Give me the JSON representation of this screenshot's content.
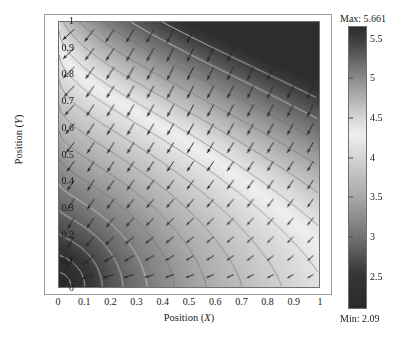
{
  "chart_data": {
    "type": "heatmap",
    "title": "",
    "subtitle": "",
    "xlabel": "Position (X)",
    "ylabel": "Position (Y)",
    "xlabel_symbol": "X",
    "ylabel_symbol": "Y",
    "xlabel_prefix": "Position (",
    "ylabel_prefix": "Position (",
    "label_suffix": ")",
    "xlim": [
      0,
      1
    ],
    "ylim": [
      0,
      1
    ],
    "xticks": [
      "0",
      "0.1",
      "0.2",
      "0.3",
      "0.4",
      "0.5",
      "0.6",
      "0.7",
      "0.8",
      "0.9",
      "1"
    ],
    "yticks": [
      "0",
      "0.1",
      "0.2",
      "0.3",
      "0.4",
      "0.5",
      "0.6",
      "0.7",
      "0.8",
      "0.9",
      "1"
    ],
    "xtick_values": [
      0,
      0.1,
      0.2,
      0.3,
      0.4,
      0.5,
      0.6,
      0.7,
      0.8,
      0.9,
      1
    ],
    "ytick_values": [
      0,
      0.1,
      0.2,
      0.3,
      0.4,
      0.5,
      0.6,
      0.7,
      0.8,
      0.9,
      1
    ],
    "grid": false,
    "legend": "none",
    "overlays": [
      "contour-lines",
      "vector-field-arrows"
    ],
    "zmin": 2.09,
    "zmax": 5.661,
    "colorbar": {
      "max_label": "Max: 5.661",
      "min_label": "Min: 2.09",
      "max_value": 5.661,
      "min_value": 2.09,
      "orientation": "vertical",
      "position": "right",
      "colormap": "grayscale-nonmonotonic",
      "ticks": [
        "5.5",
        "5",
        "4.5",
        "4",
        "3.5",
        "3",
        "2.5"
      ],
      "tick_values": [
        5.5,
        5.0,
        4.5,
        4.0,
        3.5,
        3.0,
        2.5
      ],
      "stops": [
        {
          "value": 2.09,
          "color": "#2a2a2a"
        },
        {
          "value": 2.5,
          "color": "#353535"
        },
        {
          "value": 3.0,
          "color": "#737373"
        },
        {
          "value": 3.5,
          "color": "#a9a9a9"
        },
        {
          "value": 4.0,
          "color": "#d4d4d4"
        },
        {
          "value": 4.3,
          "color": "#efefef"
        },
        {
          "value": 4.5,
          "color": "#d8d8d8"
        },
        {
          "value": 5.0,
          "color": "#8e8e8e"
        },
        {
          "value": 5.5,
          "color": "#3d3d3d"
        },
        {
          "value": 5.661,
          "color": "#2e2e2e"
        }
      ]
    },
    "field_description": "Scalar potential field over unit square with overlaid gradient arrows and contour lines",
    "arrow_grid": {
      "cols": 13,
      "rows": 14
    },
    "corner_values": {
      "bottom_left": 2.09,
      "top_left": 4.6,
      "top_right": 5.661,
      "bottom_right": 4.1
    }
  },
  "colors": {
    "frame": "#9a9a9a",
    "plot_border": "#707070",
    "text": "#1a1a1a",
    "contour": "#b9b9b9",
    "arrow": "#2b2b2b"
  }
}
